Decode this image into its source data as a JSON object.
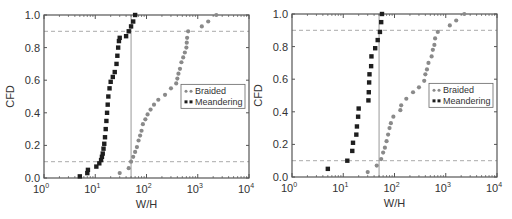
{
  "chart_data": [
    {
      "type": "scatter",
      "panel": "left",
      "title": "",
      "xlabel": "W/H",
      "ylabel": "CFD",
      "xscale": "log",
      "xlim": [
        1,
        10000
      ],
      "ylim": [
        0.0,
        1.0
      ],
      "xticks": [
        "10^0",
        "10^1",
        "10^2",
        "10^3",
        "10^4"
      ],
      "yticks": [
        "0.0",
        "0.2",
        "0.4",
        "0.6",
        "0.8",
        "1.0"
      ],
      "reference_lines": {
        "horizontal": [
          0.1,
          0.9
        ],
        "vertical": 50
      },
      "legend": {
        "position": "center-right",
        "entries": [
          "Braided",
          "Meandering"
        ]
      },
      "series": [
        {
          "name": "Braided",
          "marker": "circle",
          "color": "#888888",
          "points": [
            [
              30,
              0.03
            ],
            [
              45,
              0.06
            ],
            [
              50,
              0.1
            ],
            [
              55,
              0.13
            ],
            [
              60,
              0.16
            ],
            [
              65,
              0.19
            ],
            [
              70,
              0.23
            ],
            [
              75,
              0.26
            ],
            [
              80,
              0.29
            ],
            [
              85,
              0.33
            ],
            [
              95,
              0.36
            ],
            [
              105,
              0.39
            ],
            [
              120,
              0.42
            ],
            [
              140,
              0.45
            ],
            [
              170,
              0.48
            ],
            [
              230,
              0.51
            ],
            [
              300,
              0.55
            ],
            [
              380,
              0.58
            ],
            [
              400,
              0.61
            ],
            [
              420,
              0.64
            ],
            [
              450,
              0.67
            ],
            [
              480,
              0.71
            ],
            [
              520,
              0.74
            ],
            [
              560,
              0.77
            ],
            [
              600,
              0.8
            ],
            [
              610,
              0.83
            ],
            [
              620,
              0.86
            ],
            [
              650,
              0.9
            ],
            [
              1200,
              0.93
            ],
            [
              1600,
              0.96
            ],
            [
              2300,
              1.0
            ]
          ]
        },
        {
          "name": "Meandering",
          "marker": "square",
          "color": "#222222",
          "points": [
            [
              5,
              0.01
            ],
            [
              7,
              0.03
            ],
            [
              7.2,
              0.05
            ],
            [
              10.5,
              0.07
            ],
            [
              12,
              0.09
            ],
            [
              13,
              0.11
            ],
            [
              13.5,
              0.13
            ],
            [
              14,
              0.15
            ],
            [
              14.5,
              0.18
            ],
            [
              15,
              0.21
            ],
            [
              15.5,
              0.25
            ],
            [
              16,
              0.3
            ],
            [
              16.5,
              0.35
            ],
            [
              17,
              0.4
            ],
            [
              17.5,
              0.45
            ],
            [
              18,
              0.5
            ],
            [
              19,
              0.55
            ],
            [
              20,
              0.59
            ],
            [
              22,
              0.62
            ],
            [
              24,
              0.65
            ],
            [
              26,
              0.7
            ],
            [
              27,
              0.75
            ],
            [
              28,
              0.8
            ],
            [
              29,
              0.84
            ],
            [
              30,
              0.86
            ],
            [
              40,
              0.87
            ],
            [
              45,
              0.9
            ],
            [
              50,
              0.93
            ],
            [
              55,
              0.96
            ],
            [
              60,
              1.0
            ]
          ]
        }
      ]
    },
    {
      "type": "scatter",
      "panel": "right",
      "title": "",
      "xlabel": "W/H",
      "ylabel": "CFD",
      "xscale": "log",
      "xlim": [
        1,
        10000
      ],
      "ylim": [
        0.0,
        1.0
      ],
      "xticks": [
        "10^0",
        "10^1",
        "10^2",
        "10^3",
        "10^4"
      ],
      "yticks": [
        "0.0",
        "0.2",
        "0.4",
        "0.6",
        "0.8",
        "1.0"
      ],
      "reference_lines": {
        "horizontal": [
          0.1,
          0.9
        ],
        "vertical": 50
      },
      "legend": {
        "position": "center-right",
        "entries": [
          "Braided",
          "Meandering"
        ]
      },
      "series": [
        {
          "name": "Braided",
          "marker": "circle",
          "color": "#888888",
          "points": [
            [
              30,
              0.03
            ],
            [
              45,
              0.07
            ],
            [
              55,
              0.11
            ],
            [
              60,
              0.15
            ],
            [
              65,
              0.18
            ],
            [
              70,
              0.22
            ],
            [
              75,
              0.26
            ],
            [
              80,
              0.3
            ],
            [
              85,
              0.33
            ],
            [
              95,
              0.37
            ],
            [
              130,
              0.41
            ],
            [
              135,
              0.44
            ],
            [
              170,
              0.48
            ],
            [
              230,
              0.52
            ],
            [
              300,
              0.55
            ],
            [
              380,
              0.59
            ],
            [
              400,
              0.63
            ],
            [
              430,
              0.66
            ],
            [
              460,
              0.7
            ],
            [
              530,
              0.74
            ],
            [
              560,
              0.78
            ],
            [
              600,
              0.81
            ],
            [
              620,
              0.85
            ],
            [
              700,
              0.89
            ],
            [
              1200,
              0.93
            ],
            [
              1600,
              0.96
            ],
            [
              2300,
              1.0
            ]
          ]
        },
        {
          "name": "Meandering",
          "marker": "square",
          "color": "#222222",
          "points": [
            [
              5,
              0.05
            ],
            [
              12,
              0.1
            ],
            [
              15,
              0.16
            ],
            [
              15.5,
              0.21
            ],
            [
              18,
              0.26
            ],
            [
              18.5,
              0.31
            ],
            [
              19.5,
              0.37
            ],
            [
              20,
              0.42
            ],
            [
              31,
              0.47
            ],
            [
              31.5,
              0.52
            ],
            [
              32,
              0.58
            ],
            [
              32.5,
              0.63
            ],
            [
              35,
              0.68
            ],
            [
              35.5,
              0.74
            ],
            [
              42,
              0.79
            ],
            [
              47,
              0.84
            ],
            [
              52,
              0.89
            ],
            [
              55,
              0.95
            ],
            [
              57,
              1.0
            ]
          ]
        }
      ]
    }
  ],
  "panels": {
    "left": {
      "xlabel": "W/H",
      "ylabel": "CFD",
      "legend_braided": "Braided",
      "legend_meandering": "Meandering"
    },
    "right": {
      "xlabel": "W/H",
      "ylabel": "CFD",
      "legend_braided": "Braided",
      "legend_meandering": "Meandering"
    }
  },
  "ticks": {
    "y": [
      "0.0",
      "0.2",
      "0.4",
      "0.6",
      "0.8",
      "1.0"
    ],
    "x_base": "10",
    "x_exp": [
      "0",
      "1",
      "2",
      "3",
      "4"
    ]
  },
  "colors": {
    "braided": "#8a8a8a",
    "meandering": "#1e1e1e",
    "axis": "#555555",
    "refline": "#aaaaaa"
  }
}
